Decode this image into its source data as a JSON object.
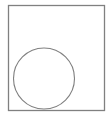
{
  "figure": {
    "background": "#ffffff",
    "stroke_color": "#808080",
    "frame": {
      "x": 8.5,
      "y": 5.5,
      "width": 96,
      "height": 105
    },
    "circle": {
      "cx": 44,
      "cy": 78.5,
      "r": 30.5
    }
  }
}
